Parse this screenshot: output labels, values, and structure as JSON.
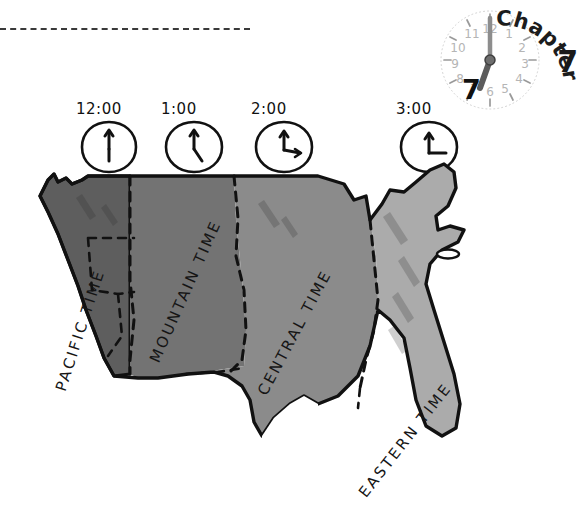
{
  "page": {
    "chapter_label": "Chapter",
    "chapter_number": "7",
    "clock_face_number": "7",
    "clock_numerals": [
      "1",
      "2",
      "3",
      "4",
      "5",
      "6",
      "7",
      "8",
      "9",
      "10",
      "11",
      "12"
    ]
  },
  "clocks": [
    {
      "name": "pacific-clock",
      "time": "12:00",
      "hour_angle": 0,
      "minute_angle": 0,
      "x": 72,
      "y": 0
    },
    {
      "name": "mountain-clock",
      "time": "1:00",
      "hour_angle": 30,
      "minute_angle": 0,
      "x": 157,
      "y": 0
    },
    {
      "name": "central-clock",
      "time": "2:00",
      "hour_angle": 60,
      "minute_angle": 0,
      "x": 247,
      "y": 0
    },
    {
      "name": "eastern-clock",
      "time": "3:00",
      "hour_angle": 90,
      "minute_angle": 0,
      "x": 392,
      "y": 0
    }
  ],
  "map": {
    "alt": "Outline map of the contiguous United States divided into four time zones",
    "zones": [
      {
        "id": "pacific",
        "label": "PACIFIC TIME",
        "color": "#5e5e5e"
      },
      {
        "id": "mountain",
        "label": "MOUNTAIN TIME",
        "color": "#737373"
      },
      {
        "id": "central",
        "label": "CENTRAL TIME",
        "color": "#8b8b8b"
      },
      {
        "id": "eastern",
        "label": "EASTERN TIME",
        "color": "#ababab"
      }
    ],
    "outline_color": "#111111",
    "zone_divider_style": "dashed",
    "state_divider_style": "dashed"
  },
  "decor": {
    "top_rule_style": "dashed",
    "background": "#ffffff"
  }
}
